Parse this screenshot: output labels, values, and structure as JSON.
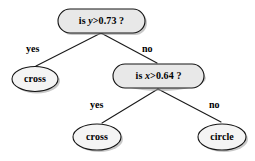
{
  "diagram": {
    "type": "decision-tree",
    "title": "",
    "nodes": {
      "root": {
        "id": "root",
        "kind": "decision",
        "prefix": "is ",
        "variable": "y",
        "condition": ">0.73",
        "suffix": " ?",
        "full_text": "is y>0.73 ?"
      },
      "leaf_left": {
        "id": "leaf_left",
        "kind": "leaf",
        "label": "cross"
      },
      "split2": {
        "id": "split2",
        "kind": "decision",
        "prefix": "is ",
        "variable": "x",
        "condition": ">0.64",
        "suffix": " ?",
        "full_text": "is x>0.64 ?"
      },
      "leaf_mid": {
        "id": "leaf_mid",
        "kind": "leaf",
        "label": "cross"
      },
      "leaf_right": {
        "id": "leaf_right",
        "kind": "leaf",
        "label": "circle"
      }
    },
    "edges": [
      {
        "id": "root-yes",
        "from": "root",
        "to": "leaf_left",
        "label": "yes"
      },
      {
        "id": "root-no",
        "from": "root",
        "to": "split2",
        "label": "no"
      },
      {
        "id": "split2-yes",
        "from": "split2",
        "to": "leaf_mid",
        "label": "yes"
      },
      {
        "id": "split2-no",
        "from": "split2",
        "to": "leaf_right",
        "label": "no"
      }
    ],
    "colors": {
      "background": "#ffffff",
      "decision_fill": "#e8e8e8",
      "leaf_fill": "#f4f4f4",
      "stroke": "#141414",
      "shadow": "#9a9a9a",
      "text": "#000000"
    }
  }
}
